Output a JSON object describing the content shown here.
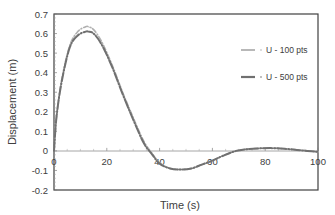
{
  "chart_data": {
    "type": "line",
    "title": "",
    "xlabel": "Time (s)",
    "ylabel": "Displacement (m)",
    "xlim": [
      0,
      100
    ],
    "ylim": [
      -0.2,
      0.7
    ],
    "xticks": [
      "0",
      "20",
      "40",
      "60",
      "80",
      "100"
    ],
    "yticks": [
      "-0.2",
      "-0.1",
      "0",
      "0.1",
      "0.2",
      "0.3",
      "0.4",
      "0.5",
      "0.6",
      "0.7"
    ],
    "grid": false,
    "legend_position": "right-inside",
    "series": [
      {
        "name": "U - 100 pts",
        "color": "#b0b0b0",
        "style": "dash-dot",
        "x": [
          0,
          1,
          3,
          6,
          9,
          12,
          13,
          15,
          18,
          22,
          26,
          30,
          34,
          37,
          40,
          44,
          48,
          52,
          56,
          60,
          64,
          69,
          74,
          78,
          83,
          88,
          92,
          96,
          100
        ],
        "values": [
          0.0,
          0.18,
          0.37,
          0.54,
          0.61,
          0.635,
          0.635,
          0.62,
          0.56,
          0.44,
          0.3,
          0.17,
          0.05,
          -0.01,
          -0.06,
          -0.09,
          -0.095,
          -0.09,
          -0.07,
          -0.05,
          -0.025,
          0.0,
          0.01,
          0.013,
          0.014,
          0.01,
          0.005,
          0.0,
          -0.005
        ]
      },
      {
        "name": "U - 500 pts",
        "color": "#707070",
        "style": "long-dash-dot",
        "x": [
          0,
          1,
          3,
          6,
          9,
          12,
          13,
          15,
          18,
          22,
          26,
          30,
          34,
          37,
          40,
          44,
          48,
          52,
          56,
          60,
          64,
          69,
          74,
          78,
          83,
          88,
          92,
          96,
          100
        ],
        "values": [
          0.0,
          0.18,
          0.36,
          0.53,
          0.59,
          0.61,
          0.61,
          0.6,
          0.545,
          0.43,
          0.29,
          0.16,
          0.04,
          -0.015,
          -0.065,
          -0.09,
          -0.095,
          -0.09,
          -0.07,
          -0.05,
          -0.025,
          0.0,
          0.01,
          0.013,
          0.014,
          0.01,
          0.005,
          0.0,
          -0.005
        ]
      }
    ]
  },
  "legend": {
    "items": [
      {
        "label": "U - 100 pts"
      },
      {
        "label": "U - 500 pts"
      }
    ]
  },
  "axes": {
    "xlabel": "Time (s)",
    "ylabel": "Displacement (m)"
  }
}
